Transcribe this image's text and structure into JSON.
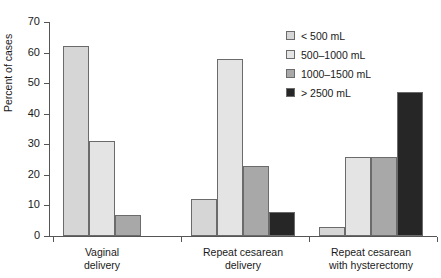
{
  "chart_data": {
    "type": "bar",
    "title": "",
    "xlabel": "",
    "ylabel": "Percent of cases",
    "ylim": [
      0,
      70
    ],
    "ytick_labels": [
      "70",
      "60",
      "50",
      "40",
      "30",
      "20",
      "10",
      "0"
    ],
    "ytick_values": [
      70,
      60,
      50,
      40,
      30,
      20,
      10,
      0
    ],
    "grid": false,
    "legend_position": "top-right",
    "categories": [
      "Vaginal delivery",
      "Repeat cesarean delivery",
      "Repeat cesarean with hysterectomy"
    ],
    "category_lines": [
      [
        "Vaginal",
        "delivery"
      ],
      [
        "Repeat cesarean",
        "delivery"
      ],
      [
        "Repeat cesarean",
        "with hysterectomy"
      ]
    ],
    "series": [
      {
        "name": "< 500 mL",
        "color": "#d6d6d6",
        "values": [
          62,
          12,
          3
        ]
      },
      {
        "name": "500–1000 mL",
        "color": "#e4e4e4",
        "values": [
          31,
          58,
          26
        ]
      },
      {
        "name": "1000–1500 mL",
        "color": "#a8a8a8",
        "values": [
          7,
          23,
          26
        ]
      },
      {
        "name": "> 2500 mL",
        "color": "#262626",
        "values": [
          null,
          8,
          47
        ]
      }
    ]
  },
  "colors": {
    "axis": "#555555",
    "bar_outline": "#6b6b6b",
    "text": "#1a1a1a",
    "background": "#ffffff"
  }
}
